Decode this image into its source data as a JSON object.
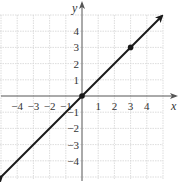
{
  "chart_data": {
    "type": "line",
    "title": "",
    "xlabel": "x",
    "ylabel": "y",
    "xlim": [
      -5,
      5
    ],
    "ylim": [
      -5,
      5
    ],
    "grid": true,
    "x_ticks": [
      -4,
      -3,
      -2,
      -1,
      1,
      2,
      3,
      4
    ],
    "y_ticks": [
      -4,
      -3,
      -2,
      -1,
      1,
      2,
      3,
      4
    ],
    "x_tick_labels": [
      "−4",
      "−3",
      "−2",
      "−1",
      "1",
      "2",
      "3",
      "4"
    ],
    "y_tick_labels": [
      "−4",
      "−3",
      "−2",
      "−1",
      "1",
      "2",
      "3",
      "4"
    ],
    "series": [
      {
        "name": "y = x",
        "equation": "y = x",
        "x": [
          -5,
          5
        ],
        "y": [
          -5,
          5
        ],
        "arrows": "both",
        "color": "#1a1a1a"
      }
    ],
    "points": [
      {
        "x": 0,
        "y": 0
      },
      {
        "x": 3,
        "y": 3
      }
    ],
    "legend": null
  },
  "axes": {
    "x_label": "x",
    "y_label": "y"
  }
}
